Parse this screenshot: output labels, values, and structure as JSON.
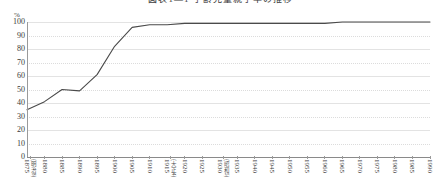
{
  "chart_title": "図表1―1 学齢児童就学率の推移",
  "y_unit": "%",
  "axis": {
    "y_ticks": [
      "100",
      "90",
      "80",
      "70",
      "60",
      "50",
      "40",
      "30",
      "20",
      "10",
      "0"
    ],
    "ylabel": "%",
    "xlabel": ""
  },
  "chart_data": {
    "type": "line",
    "title": "図表1―1 学齢児童就学率の推移",
    "xlabel": "",
    "ylabel": "%",
    "ylim": [
      0,
      100
    ],
    "grid": true,
    "legend": "none",
    "categories": [
      "1875",
      "1880",
      "1885",
      "1890",
      "1895",
      "1900",
      "1905",
      "1910",
      "1915",
      "1920",
      "1925",
      "1930",
      "1935",
      "1940",
      "1945",
      "1950",
      "1955",
      "1960",
      "1965",
      "1970",
      "1975",
      "1980",
      "1985",
      "1990"
    ],
    "tick_annotations": {
      "1875": "(明治8)",
      "1915": "(大正4)",
      "1930": "(昭和5)"
    },
    "series": [
      {
        "name": "就学率",
        "values": [
          35,
          41,
          50,
          49,
          61,
          82,
          96,
          98,
          98,
          99,
          99,
          99,
          99,
          99,
          99,
          99,
          99,
          99,
          100,
          100,
          100,
          100,
          100,
          100
        ]
      }
    ],
    "color": "#4a4a4a"
  },
  "xticks": [
    {
      "year": "1875",
      "era": "(明治8)"
    },
    {
      "year": "1880",
      "era": ""
    },
    {
      "year": "1885",
      "era": ""
    },
    {
      "year": "1890",
      "era": ""
    },
    {
      "year": "1895",
      "era": ""
    },
    {
      "year": "1900",
      "era": ""
    },
    {
      "year": "1905",
      "era": ""
    },
    {
      "year": "1910",
      "era": ""
    },
    {
      "year": "1915",
      "era": "(大正4)"
    },
    {
      "year": "1920",
      "era": ""
    },
    {
      "year": "1925",
      "era": ""
    },
    {
      "year": "1930",
      "era": "(昭和5)"
    },
    {
      "year": "1935",
      "era": ""
    },
    {
      "year": "1940",
      "era": ""
    },
    {
      "year": "1945",
      "era": ""
    },
    {
      "year": "1950",
      "era": ""
    },
    {
      "year": "1955",
      "era": ""
    },
    {
      "year": "1960",
      "era": ""
    },
    {
      "year": "1965",
      "era": ""
    },
    {
      "year": "1970",
      "era": ""
    },
    {
      "year": "1975",
      "era": ""
    },
    {
      "year": "1980",
      "era": ""
    },
    {
      "year": "1985",
      "era": ""
    },
    {
      "year": "1990",
      "era": ""
    }
  ]
}
